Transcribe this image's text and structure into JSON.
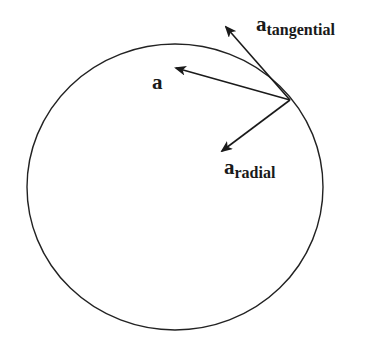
{
  "diagram": {
    "title": "",
    "circle": {
      "cx": 175,
      "cy": 187,
      "rx": 148,
      "ry": 143,
      "stroke": "#222222"
    },
    "origin_point": {
      "x": 290,
      "y": 100
    },
    "vectors": [
      {
        "id": "a_tangential",
        "tip": {
          "x": 226,
          "y": 27
        },
        "color": "#1a1a1a"
      },
      {
        "id": "a",
        "tip": {
          "x": 176,
          "y": 68
        },
        "color": "#1a1a1a"
      },
      {
        "id": "a_radial",
        "tip": {
          "x": 222,
          "y": 151
        },
        "color": "#1a1a1a"
      }
    ],
    "labels": {
      "tangential": {
        "main": "a",
        "sub": "tangential"
      },
      "total": {
        "main": "a"
      },
      "radial": {
        "main": "a",
        "sub": "radial"
      }
    }
  }
}
